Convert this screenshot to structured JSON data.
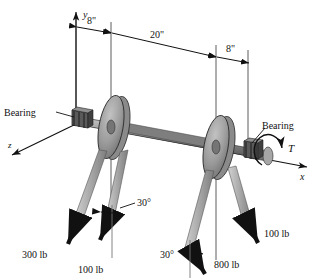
{
  "figure": {
    "type": "engineering-free-body-diagram",
    "background_color": "#ffffff",
    "line_color": "#111111",
    "pulley_fill": "#9a9a9a",
    "shaft_fill": "#8c8c8c",
    "belt_fill": "#b5b5b5",
    "arrow_fill": "#111111"
  },
  "axes": {
    "y": {
      "label": "y",
      "direction": "up"
    },
    "x": {
      "label": "x",
      "direction": "right"
    },
    "z": {
      "label": "z",
      "direction": "down-left"
    }
  },
  "dimensions": [
    {
      "id": "dim-left-8",
      "label": "8\"",
      "value": 8,
      "unit": "in"
    },
    {
      "id": "dim-middle-20",
      "label": "20\"",
      "value": 20,
      "unit": "in"
    },
    {
      "id": "dim-right-8",
      "label": "8\"",
      "value": 8,
      "unit": "in"
    }
  ],
  "bearings": [
    {
      "id": "bearing-left",
      "label": "Bearing"
    },
    {
      "id": "bearing-right",
      "label": "Bearing"
    }
  ],
  "torque": {
    "label": "T",
    "symbol": "T"
  },
  "angles": [
    {
      "id": "angle-left-pulley",
      "label": "30°",
      "value": 30,
      "unit": "deg"
    },
    {
      "id": "angle-right-pulley",
      "label": "30°",
      "value": 30,
      "unit": "deg"
    }
  ],
  "forces": [
    {
      "id": "force-300",
      "label": "300 lb",
      "magnitude": 300,
      "unit": "lb",
      "pulley": "left",
      "side": "outer"
    },
    {
      "id": "force-100-left",
      "label": "100 lb",
      "magnitude": 100,
      "unit": "lb",
      "pulley": "left",
      "side": "inner"
    },
    {
      "id": "force-800",
      "label": "800 lb",
      "magnitude": 800,
      "unit": "lb",
      "pulley": "right",
      "side": "inner"
    },
    {
      "id": "force-100-right",
      "label": "100 lb",
      "magnitude": 100,
      "unit": "lb",
      "pulley": "right",
      "side": "outer"
    }
  ]
}
